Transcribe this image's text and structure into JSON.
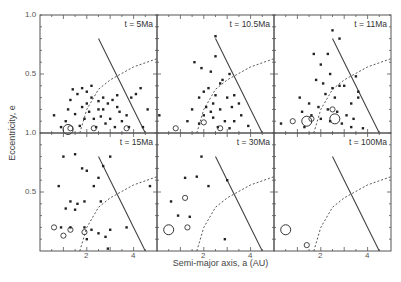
{
  "chart_data": {
    "type": "scatter",
    "layout": "2x3 panel grid sharing axes",
    "xlabel": "Semi-major axis, a (AU)",
    "ylabel": "Eccentricity, e",
    "xlim": [
      0,
      5
    ],
    "ylim": [
      0,
      1.0
    ],
    "xticks_labeled": [
      2,
      4
    ],
    "yticks_labeled": [
      0.5,
      1.0
    ],
    "ytick_label_text": {
      "top_row": [
        "1.0",
        "0.5",
        "1.0"
      ],
      "bottom_row": [
        "0.5"
      ]
    },
    "curves": [
      {
        "name": "solid-curve",
        "style": "solid",
        "points": [
          [
            2.5,
            0.8
          ],
          [
            3.0,
            0.6
          ],
          [
            3.5,
            0.4
          ],
          [
            4.0,
            0.2
          ],
          [
            4.5,
            0.0
          ]
        ]
      },
      {
        "name": "dashed-curve",
        "style": "dashed",
        "points": [
          [
            1.7,
            0.0
          ],
          [
            2.0,
            0.2
          ],
          [
            2.5,
            0.37
          ],
          [
            3.0,
            0.45
          ],
          [
            4.0,
            0.56
          ],
          [
            5.0,
            0.63
          ]
        ]
      }
    ],
    "panels": [
      {
        "label": "t = 5Ma",
        "filled": [
          [
            1.4,
            0.37
          ],
          [
            1.6,
            0.33
          ],
          [
            1.8,
            0.38
          ],
          [
            2.0,
            0.35
          ],
          [
            2.2,
            0.3
          ],
          [
            2.5,
            0.27
          ],
          [
            2.7,
            0.3
          ],
          [
            2.9,
            0.25
          ],
          [
            3.1,
            0.28
          ],
          [
            3.3,
            0.22
          ],
          [
            1.2,
            0.2
          ],
          [
            1.5,
            0.16
          ],
          [
            1.8,
            0.22
          ],
          [
            2.1,
            0.18
          ],
          [
            2.3,
            0.12
          ],
          [
            2.6,
            0.14
          ],
          [
            2.8,
            0.08
          ],
          [
            3.0,
            0.12
          ],
          [
            3.2,
            0.05
          ],
          [
            3.5,
            0.1
          ],
          [
            3.7,
            0.15
          ],
          [
            3.9,
            0.3
          ],
          [
            4.1,
            0.33
          ],
          [
            4.3,
            0.38
          ],
          [
            4.6,
            0.2
          ],
          [
            0.6,
            0.15
          ],
          [
            0.9,
            0.05
          ],
          [
            1.1,
            0.1
          ],
          [
            1.7,
            0.06
          ],
          [
            2.4,
            0.05
          ],
          [
            2.0,
            0.25
          ],
          [
            2.7,
            0.2
          ],
          [
            3.3,
            0.32
          ],
          [
            2.2,
            0.4
          ],
          [
            1.3,
            0.28
          ],
          [
            4.4,
            0.05
          ],
          [
            3.8,
            0.05
          ],
          [
            1.9,
            0.12
          ],
          [
            2.5,
            0.2
          ],
          [
            3.4,
            0.18
          ]
        ],
        "open": [
          [
            1.3,
            0.04
          ],
          [
            2.3,
            0.04
          ],
          [
            3.7,
            0.04
          ]
        ],
        "open_large": [
          [
            1.2,
            0.03
          ]
        ]
      },
      {
        "label": "t = 10.5Ma",
        "filled": [
          [
            2.5,
            0.82
          ],
          [
            2.5,
            0.65
          ],
          [
            1.6,
            0.6
          ],
          [
            1.9,
            0.55
          ],
          [
            2.3,
            0.52
          ],
          [
            3.1,
            0.5
          ],
          [
            2.8,
            0.45
          ],
          [
            2.7,
            0.42
          ],
          [
            2.2,
            0.38
          ],
          [
            2.0,
            0.35
          ],
          [
            2.5,
            0.32
          ],
          [
            3.0,
            0.3
          ],
          [
            3.3,
            0.32
          ],
          [
            1.8,
            0.3
          ],
          [
            2.4,
            0.25
          ],
          [
            2.1,
            0.22
          ],
          [
            2.7,
            0.2
          ],
          [
            3.2,
            0.22
          ],
          [
            3.5,
            0.25
          ],
          [
            1.5,
            0.2
          ],
          [
            2.0,
            0.15
          ],
          [
            2.4,
            0.13
          ],
          [
            2.9,
            0.1
          ],
          [
            3.3,
            0.1
          ],
          [
            3.6,
            0.15
          ],
          [
            1.3,
            0.1
          ],
          [
            1.8,
            0.08
          ],
          [
            2.6,
            0.05
          ],
          [
            3.1,
            0.04
          ],
          [
            0.1,
            0.15
          ],
          [
            2.3,
            0.18
          ],
          [
            3.9,
            0.06
          ]
        ],
        "open": [
          [
            0.8,
            0.04
          ],
          [
            2.0,
            0.09
          ],
          [
            2.7,
            0.04
          ]
        ],
        "open_large": []
      },
      {
        "label": "t = 11Ma",
        "filled": [
          [
            2.5,
            0.87
          ],
          [
            2.8,
            0.8
          ],
          [
            1.7,
            0.67
          ],
          [
            2.3,
            0.67
          ],
          [
            2.0,
            0.58
          ],
          [
            2.4,
            0.5
          ],
          [
            1.8,
            0.45
          ],
          [
            2.1,
            0.42
          ],
          [
            2.5,
            0.38
          ],
          [
            2.8,
            0.4
          ],
          [
            3.0,
            0.4
          ],
          [
            3.5,
            0.48
          ],
          [
            2.2,
            0.33
          ],
          [
            2.6,
            0.3
          ],
          [
            3.3,
            0.25
          ],
          [
            3.6,
            0.3
          ],
          [
            1.1,
            0.3
          ],
          [
            1.5,
            0.25
          ],
          [
            1.9,
            0.22
          ],
          [
            2.3,
            0.2
          ],
          [
            2.7,
            0.18
          ],
          [
            3.1,
            0.15
          ],
          [
            3.4,
            0.12
          ],
          [
            1.2,
            0.18
          ],
          [
            1.6,
            0.15
          ],
          [
            2.0,
            0.12
          ],
          [
            2.4,
            0.1
          ],
          [
            2.9,
            0.08
          ],
          [
            3.3,
            0.05
          ],
          [
            3.8,
            0.04
          ],
          [
            1.3,
            0.05
          ],
          [
            0.3,
            0.08
          ],
          [
            3.6,
            0.35
          ]
        ],
        "open": [
          [
            0.8,
            0.1
          ],
          [
            1.6,
            0.12
          ],
          [
            2.5,
            0.2
          ]
        ],
        "open_large": [
          [
            1.4,
            0.1
          ],
          [
            2.6,
            0.12
          ]
        ]
      },
      {
        "label": "t = 15Ma",
        "filled": [
          [
            1.0,
            0.8
          ],
          [
            1.5,
            0.82
          ],
          [
            1.8,
            0.7
          ],
          [
            2.0,
            0.68
          ],
          [
            3.0,
            0.8
          ],
          [
            2.7,
            0.72
          ],
          [
            2.5,
            0.62
          ],
          [
            2.3,
            0.55
          ],
          [
            0.8,
            0.55
          ],
          [
            2.6,
            0.42
          ],
          [
            1.3,
            0.42
          ],
          [
            1.6,
            0.4
          ],
          [
            1.9,
            0.42
          ],
          [
            1.1,
            0.36
          ],
          [
            1.5,
            0.35
          ],
          [
            0.9,
            0.2
          ],
          [
            1.3,
            0.2
          ],
          [
            1.9,
            0.2
          ],
          [
            2.2,
            0.18
          ],
          [
            2.0,
            0.1
          ],
          [
            2.5,
            0.15
          ],
          [
            2.8,
            0.12
          ],
          [
            3.0,
            0.18
          ],
          [
            3.7,
            0.2
          ],
          [
            4.7,
            0.55
          ],
          [
            2.9,
            0.02
          ]
        ],
        "open": [
          [
            0.6,
            0.2
          ],
          [
            1.0,
            0.13
          ],
          [
            1.3,
            0.18
          ],
          [
            1.9,
            0.16
          ]
        ],
        "open_large": []
      },
      {
        "label": "t = 30Ma",
        "filled": [
          [
            1.9,
            0.8
          ],
          [
            1.2,
            0.62
          ],
          [
            1.7,
            0.63
          ],
          [
            2.2,
            0.55
          ],
          [
            3.0,
            0.6
          ],
          [
            0.9,
            0.3
          ],
          [
            1.4,
            0.29
          ],
          [
            2.9,
            0.1
          ],
          [
            0.6,
            0.42
          ]
        ],
        "open": [
          [
            1.2,
            0.45
          ],
          [
            1.3,
            0.2
          ]
        ],
        "open_large": [
          [
            0.5,
            0.18
          ]
        ]
      },
      {
        "label": "t = 100Ma",
        "filled": [],
        "open": [
          [
            1.4,
            0.05
          ]
        ],
        "open_large": [
          [
            0.5,
            0.18
          ]
        ]
      }
    ]
  },
  "labels": {
    "xlabel": "Semi-major axis, a (AU)",
    "ylabel": "Eccentricity, e",
    "y_top_1": "1.0",
    "y_top_05": "0.5",
    "y_mid_1": "1.0",
    "y_bot_05": "0.5",
    "x_ticks": [
      "2",
      "4",
      "2",
      "4",
      "2",
      "4"
    ]
  }
}
